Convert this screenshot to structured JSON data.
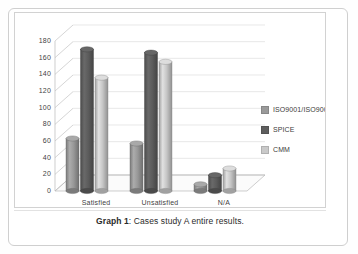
{
  "figure": {
    "caption_label": "Graph 1",
    "caption_separator": ": ",
    "caption_text": "Cases study A entire results."
  },
  "chart_data": {
    "type": "bar",
    "title": "",
    "subtitle": "",
    "xlabel": "",
    "ylabel": "",
    "categories": [
      "Satisfied",
      "Unsatisfied",
      "N/A"
    ],
    "series": [
      {
        "name": "ISO9001/ISO9000-3",
        "values": [
          63,
          57,
          8
        ],
        "color": "#9a9a9a"
      },
      {
        "name": "SPICE",
        "values": [
          170,
          166,
          19
        ],
        "color": "#5e5e5e"
      },
      {
        "name": "CMM",
        "values": [
          136,
          155,
          27
        ],
        "color": "#c9c9c9"
      }
    ],
    "ylim": [
      0,
      180
    ],
    "yticks": [
      0,
      20,
      40,
      60,
      80,
      100,
      120,
      140,
      160,
      180
    ],
    "ytick_labels": [
      "0",
      "20",
      "40",
      "60",
      "80",
      "100",
      "120",
      "140",
      "160",
      "180"
    ],
    "grid": true,
    "grid_axis": "y",
    "legend_position": "right",
    "style": "3d-cylinder",
    "background": "#ffffff",
    "axis_color": "#b9b9b9",
    "grid_color": "#d8d8d8",
    "text_color": "#3f3f3f"
  },
  "legend": {
    "items": [
      {
        "label": "ISO9001/ISO9000-3",
        "color": "#9a9a9a"
      },
      {
        "label": "SPICE",
        "color": "#5e5e5e"
      },
      {
        "label": "CMM",
        "color": "#c9c9c9"
      }
    ]
  },
  "axes": {
    "y_tick_labels": [
      "180",
      "160",
      "140",
      "120",
      "100",
      "80",
      "60",
      "40",
      "20",
      "0"
    ],
    "x_tick_labels": [
      "Satisfied",
      "Unsatisfied",
      "N/A"
    ]
  }
}
